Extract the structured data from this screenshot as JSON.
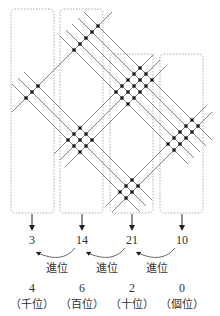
{
  "diagram": {
    "method": "line multiplication",
    "multiplicand_digits": [
      1,
      3,
      2
    ],
    "multiplier_digits": [
      3,
      5
    ],
    "column_sums": [
      "3",
      "14",
      "21",
      "10"
    ],
    "carry_label": "進位",
    "result_digits": [
      "4",
      "6",
      "2",
      "0"
    ],
    "place_labels": [
      "（千位）",
      "（百位）",
      "（十位）",
      "（個位）"
    ],
    "colors": {
      "line": "#777777",
      "dot": "#111111",
      "box": "#999999",
      "text": "#333333"
    }
  }
}
